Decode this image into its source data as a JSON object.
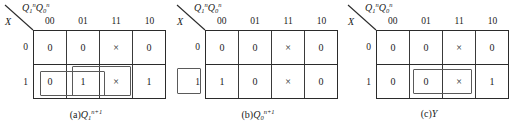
{
  "figure": {
    "width": 515,
    "height": 129,
    "background": "#ffffff",
    "line_color": "#2b2b2b",
    "group_color": "#5a5a5a"
  },
  "common": {
    "col_var_base1": "Q",
    "col_var_sub1": "1",
    "col_var_sup1": "n",
    "col_var_base2": "Q",
    "col_var_sub2": "0",
    "col_var_sup2": "n",
    "row_var": "X",
    "col_headers": [
      "00",
      "01",
      "11",
      "10"
    ],
    "row_labels": [
      "0",
      "1"
    ],
    "dont_care_glyph": "×"
  },
  "maps": [
    {
      "id": "kmap-a",
      "caption_prefix": "(a)",
      "caption_base": "Q",
      "caption_sub": "1",
      "caption_sup": "n+1",
      "rows": [
        [
          "0",
          "0",
          "×",
          "0"
        ],
        [
          "0",
          "1",
          "×",
          "1"
        ]
      ],
      "groups": [
        {
          "name": "group-01-11-row1",
          "left": 40,
          "top": 71,
          "width": 65,
          "height": 25
        },
        {
          "name": "group-11-10-row1",
          "left": 72,
          "top": 66,
          "width": 59,
          "height": 30
        }
      ]
    },
    {
      "id": "kmap-b",
      "caption_prefix": "(b)",
      "caption_base": "Q",
      "caption_sub": "0",
      "caption_sup": "n+1",
      "rows": [
        [
          "0",
          "0",
          "×",
          "0"
        ],
        [
          "1",
          "0",
          "×",
          "0"
        ]
      ],
      "groups": [
        {
          "name": "group-00-row1",
          "left": 5,
          "top": 68,
          "width": 24,
          "height": 26
        }
      ]
    },
    {
      "id": "kmap-c",
      "caption_prefix": "(c)",
      "caption_base": "Y",
      "caption_sub": "",
      "caption_sup": "",
      "rows": [
        [
          "0",
          "0",
          "×",
          "0"
        ],
        [
          "0",
          "0",
          "×",
          "1"
        ]
      ],
      "groups": [
        {
          "name": "group-11-10-row1",
          "left": 70,
          "top": 69,
          "width": 59,
          "height": 25
        }
      ]
    }
  ]
}
